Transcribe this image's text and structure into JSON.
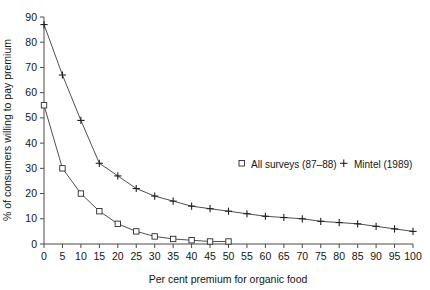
{
  "figure": {
    "top_artifact_text": "",
    "background": "#ffffff"
  },
  "chart_data": {
    "type": "line",
    "title": "",
    "xlabel": "Per cent premium for organic food",
    "ylabel": "% of consumers willing to pay premium",
    "xlim": [
      0,
      100
    ],
    "ylim": [
      0,
      90
    ],
    "xticks": [
      0,
      5,
      10,
      15,
      20,
      25,
      30,
      35,
      40,
      45,
      50,
      55,
      60,
      65,
      70,
      75,
      80,
      85,
      90,
      95,
      100
    ],
    "yticks": [
      0,
      10,
      20,
      30,
      40,
      50,
      60,
      70,
      80,
      90
    ],
    "xtick_labels": [
      "0",
      "5",
      "10",
      "15",
      "20",
      "25",
      "30",
      "35",
      "40",
      "45",
      "50",
      "55",
      "60",
      "65",
      "70",
      "75",
      "80",
      "85",
      "90",
      "95",
      "100"
    ],
    "ytick_labels": [
      "0",
      "10",
      "20",
      "30",
      "40",
      "50",
      "60",
      "70",
      "80",
      "90"
    ],
    "grid": false,
    "legend_position": "center-right",
    "series": [
      {
        "name": "All surveys (87-88)",
        "legend_label": "All surveys (87–88)",
        "marker": "square",
        "color": "#2b2b2b",
        "x": [
          0,
          5,
          10,
          15,
          20,
          25,
          30,
          35,
          40,
          45,
          50
        ],
        "values": [
          55,
          30,
          20,
          13,
          8,
          5,
          3,
          2,
          1.5,
          1,
          1
        ]
      },
      {
        "name": "Mintel (1989)",
        "legend_label": "Mintel (1989)",
        "marker": "plus",
        "color": "#1f1f1f",
        "x": [
          0,
          5,
          10,
          15,
          20,
          25,
          30,
          35,
          40,
          45,
          50,
          55,
          60,
          65,
          70,
          75,
          80,
          85,
          90,
          95,
          100
        ],
        "values": [
          87,
          67,
          49,
          32,
          27,
          22,
          19,
          17,
          15,
          14,
          13,
          12,
          11,
          10.5,
          10,
          9,
          8.5,
          8,
          7,
          6,
          5
        ]
      }
    ]
  },
  "legend": {
    "square_marker_label": "All surveys (87–88)",
    "plus_marker_label": "Mintel (1989)",
    "plus_glyph": "+",
    "square_glyph": "□"
  }
}
